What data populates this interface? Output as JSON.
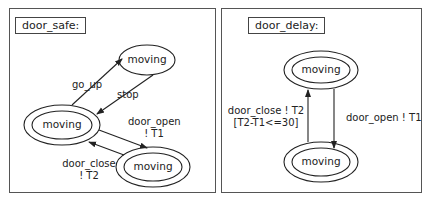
{
  "diagrams": [
    {
      "title": "door_safe:",
      "states": [
        {
          "id": "s1",
          "label": "moving",
          "final": false
        },
        {
          "id": "s2",
          "label": "moving",
          "final": true
        },
        {
          "id": "s3",
          "label": "moving",
          "final": true
        }
      ],
      "transitions": [
        {
          "from": "s2",
          "to": "s1",
          "label_line1": "go_up",
          "label_line2": ""
        },
        {
          "from": "s1",
          "to": "s2",
          "label_line1": "stop",
          "label_line2": ""
        },
        {
          "from": "s2",
          "to": "s3",
          "label_line1": "door_open",
          "label_line2": "! T1"
        },
        {
          "from": "s3",
          "to": "s2",
          "label_line1": "door_close",
          "label_line2": "! T2"
        }
      ]
    },
    {
      "title": "door_delay:",
      "states": [
        {
          "id": "s1",
          "label": "moving",
          "final": true
        },
        {
          "id": "s2",
          "label": "moving",
          "final": true
        }
      ],
      "transitions": [
        {
          "from": "s2",
          "to": "s1",
          "label_line1": "door_close ! T2",
          "label_line2": "[T2-T1<=30]"
        },
        {
          "from": "s1",
          "to": "s2",
          "label_line1": "door_open ! T1",
          "label_line2": ""
        }
      ]
    }
  ]
}
